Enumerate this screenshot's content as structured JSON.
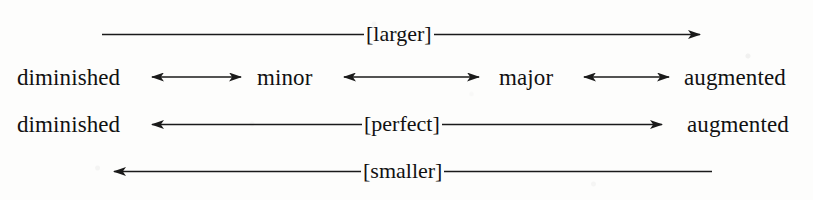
{
  "figure": {
    "kind": "interval-quality-continuum-diagram",
    "background_color": "#fdfdfc",
    "ink_color": "#1a1a1a",
    "rows": [
      {
        "id": "larger",
        "label": "[larger]",
        "direction": "right",
        "left_term": "",
        "right_term": ""
      },
      {
        "id": "imperfect-intervals",
        "label": "",
        "direction": "both",
        "terms": [
          "diminished",
          "minor",
          "major",
          "augmented"
        ]
      },
      {
        "id": "perfect-intervals",
        "label": "[perfect]",
        "direction": "both",
        "left_term": "diminished",
        "right_term": "augmented"
      },
      {
        "id": "smaller",
        "label": "[smaller]",
        "direction": "left",
        "left_term": "",
        "right_term": ""
      }
    ]
  },
  "labels": {
    "larger": "[larger]",
    "perfect": "[perfect]",
    "smaller": "[smaller]",
    "diminished_row2": "diminished",
    "minor": "minor",
    "major": "major",
    "augmented_row2": "augmented",
    "diminished_row3": "diminished",
    "augmented_row3": "augmented"
  }
}
